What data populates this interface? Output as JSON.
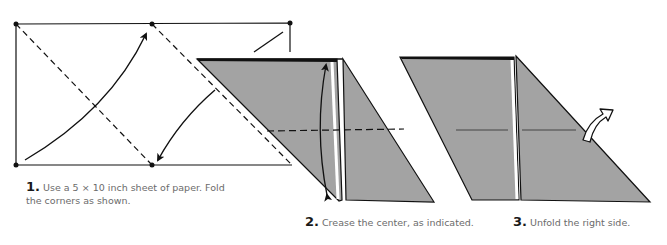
{
  "steps": [
    {
      "number": "1.",
      "text": "Use a 5 × 10 inch sheet of paper. Fold the corners as shown."
    },
    {
      "number": "2.",
      "text": "Crease the center, as indicated."
    },
    {
      "number": "3.",
      "text": "Unfold the right side."
    }
  ],
  "colors": {
    "paper_shade": "#a3a3a3",
    "line": "#111111",
    "text": "#6b6b6b"
  }
}
